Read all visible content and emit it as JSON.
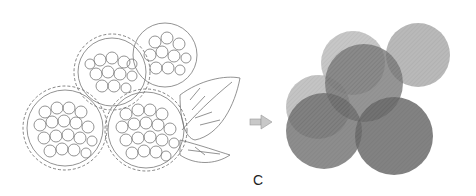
{
  "figure": {
    "panel_label": "C",
    "left_panel": {
      "description": "Line drawing of raspberry cluster with leaves, berries outlined with dashed circles",
      "berries": [
        {
          "cx": 112,
          "cy": 72,
          "r": 36
        },
        {
          "cx": 165,
          "cy": 55,
          "r": 33
        },
        {
          "cx": 65,
          "cy": 128,
          "r": 40
        },
        {
          "cx": 146,
          "cy": 130,
          "r": 40
        },
        {
          "cx": 100,
          "cy": 112,
          "r": 30
        }
      ]
    },
    "arrow": {
      "icon": "arrow-right-icon",
      "x": 250,
      "y": 122
    },
    "right_panel": {
      "description": "Overlapping translucent gray circles representing berries",
      "circles": [
        {
          "cx": 353,
          "cy": 63,
          "r": 32,
          "fill": "#b4b4b4",
          "opacity": 0.75
        },
        {
          "cx": 418,
          "cy": 55,
          "r": 32,
          "fill": "#a8a8a8",
          "opacity": 0.8
        },
        {
          "cx": 318,
          "cy": 107,
          "r": 32,
          "fill": "#b0b0b0",
          "opacity": 0.75
        },
        {
          "cx": 364,
          "cy": 83,
          "r": 39,
          "fill": "#7a7a7a",
          "opacity": 0.8
        },
        {
          "cx": 324,
          "cy": 131,
          "r": 38,
          "fill": "#707070",
          "opacity": 0.8
        },
        {
          "cx": 394,
          "cy": 136,
          "r": 39,
          "fill": "#6c6c6c",
          "opacity": 0.85
        }
      ]
    }
  }
}
